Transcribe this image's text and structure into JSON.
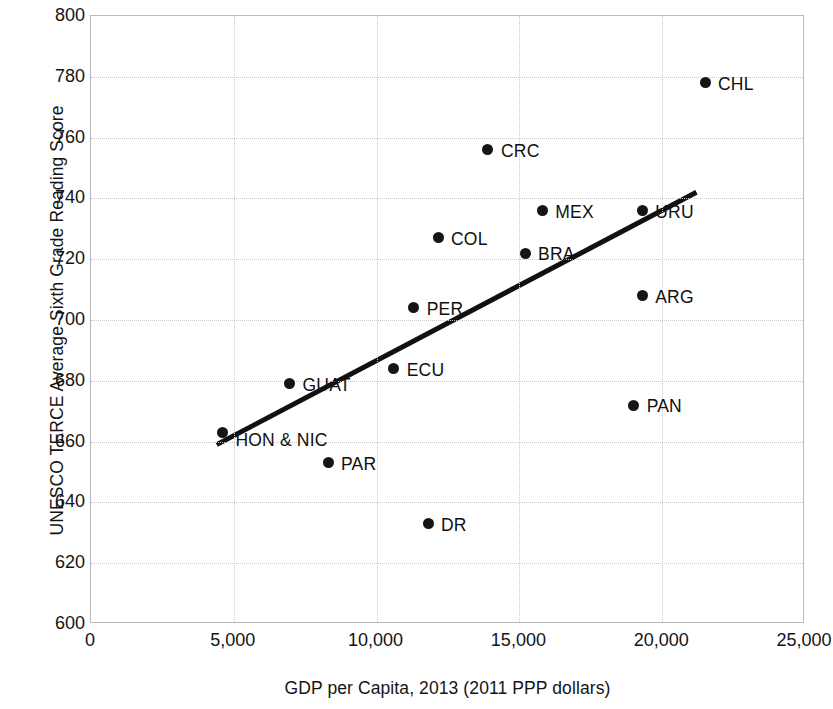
{
  "chart_data": {
    "type": "scatter",
    "title": "",
    "xlabel": "GDP per Capita, 2013 (2011 PPP dollars)",
    "ylabel": "UNESCO TERCE Average Sixth Grade Reading Score",
    "xlim": [
      0,
      25000
    ],
    "ylim": [
      600,
      800
    ],
    "xticks": [
      0,
      5000,
      10000,
      15000,
      20000,
      25000
    ],
    "xtick_labels": [
      "0",
      "5,000",
      "10,000",
      "15,000",
      "20,000",
      "25,000"
    ],
    "yticks": [
      600,
      620,
      640,
      660,
      680,
      700,
      720,
      740,
      760,
      780,
      800
    ],
    "ytick_labels": [
      "600",
      "620",
      "640",
      "660",
      "680",
      "700",
      "720",
      "740",
      "760",
      "780",
      "800"
    ],
    "grid": true,
    "legend": "none",
    "marker_color": "#151515",
    "trendline_color": "#111111",
    "points": [
      {
        "label": "HON & NIC",
        "x": 4600,
        "y": 663,
        "label_pos": "right-below"
      },
      {
        "label": "GUAT",
        "x": 6950,
        "y": 679,
        "label_pos": "right"
      },
      {
        "label": "PAR",
        "x": 8300,
        "y": 653,
        "label_pos": "right"
      },
      {
        "label": "ECU",
        "x": 10600,
        "y": 684,
        "label_pos": "right"
      },
      {
        "label": "PER",
        "x": 11300,
        "y": 704,
        "label_pos": "right"
      },
      {
        "label": "DR",
        "x": 11800,
        "y": 633,
        "label_pos": "right"
      },
      {
        "label": "COL",
        "x": 12150,
        "y": 727,
        "label_pos": "right"
      },
      {
        "label": "CRC",
        "x": 13900,
        "y": 756,
        "label_pos": "right"
      },
      {
        "label": "BRA",
        "x": 15200,
        "y": 722,
        "label_pos": "right"
      },
      {
        "label": "MEX",
        "x": 15800,
        "y": 736,
        "label_pos": "right"
      },
      {
        "label": "PAN",
        "x": 19000,
        "y": 672,
        "label_pos": "right"
      },
      {
        "label": "ARG",
        "x": 19300,
        "y": 708,
        "label_pos": "right"
      },
      {
        "label": "URU",
        "x": 19300,
        "y": 736,
        "label_pos": "right"
      },
      {
        "label": "CHL",
        "x": 21500,
        "y": 778,
        "label_pos": "right"
      }
    ],
    "trendline": {
      "x0": 4400,
      "y0": 659,
      "x1": 21200,
      "y1": 742
    }
  }
}
